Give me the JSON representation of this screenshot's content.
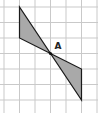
{
  "diagram": {
    "type": "grid-geometry",
    "grid": {
      "cell_size_px": 15.5,
      "vertical_lines_x": [
        4,
        19.5,
        35,
        50.5,
        66,
        81.5,
        97
      ],
      "horizontal_lines_y": [
        7,
        22.5,
        38,
        53.5,
        69,
        84.5,
        100
      ],
      "line_color": "#c9c9c9"
    },
    "point": {
      "label": "A",
      "x": 50.5,
      "y": 53.5,
      "grid_col": 3,
      "grid_row": 3
    },
    "triangles": [
      {
        "name": "upper-left-triangle",
        "vertices": [
          [
            19.5,
            7
          ],
          [
            19.5,
            38
          ],
          [
            50.5,
            53.5
          ]
        ],
        "grid_vertices": [
          [
            1,
            0
          ],
          [
            1,
            2
          ],
          [
            3,
            3
          ]
        ],
        "fill": "#a9a9a9",
        "stroke": "#1a1a1a"
      },
      {
        "name": "lower-right-triangle",
        "vertices": [
          [
            50.5,
            53.5
          ],
          [
            81.5,
            69
          ],
          [
            81.5,
            100
          ]
        ],
        "grid_vertices": [
          [
            3,
            3
          ],
          [
            5,
            4
          ],
          [
            5,
            6
          ]
        ],
        "fill": "#a9a9a9",
        "stroke": "#1a1a1a"
      }
    ]
  }
}
